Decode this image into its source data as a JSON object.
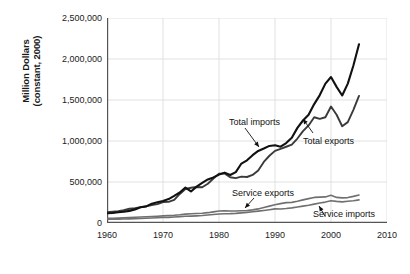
{
  "chart_data": {
    "type": "line",
    "title": "",
    "xlabel": "Year",
    "ylabel_line1": "Million Dollars",
    "ylabel_line2": "(constant, 2000)",
    "xlim": [
      1960,
      2010
    ],
    "ylim": [
      0,
      2500000
    ],
    "grid": true,
    "legend_position": "inline-annotations",
    "xticks": [
      "1960",
      "1970",
      "1980",
      "1990",
      "2000",
      "2010"
    ],
    "xtick_values": [
      1960,
      1970,
      1980,
      1990,
      2000,
      2010
    ],
    "yticks": [
      "0",
      "500,000",
      "1,000,000",
      "1,500,000",
      "2,000,000",
      "2,500,000"
    ],
    "ytick_values": [
      0,
      500000,
      1000000,
      1500000,
      2000000,
      2500000
    ],
    "x": [
      1960,
      1961,
      1962,
      1963,
      1964,
      1965,
      1966,
      1967,
      1968,
      1969,
      1970,
      1971,
      1972,
      1973,
      1974,
      1975,
      1976,
      1977,
      1978,
      1979,
      1980,
      1981,
      1982,
      1983,
      1984,
      1985,
      1986,
      1987,
      1988,
      1989,
      1990,
      1991,
      1992,
      1993,
      1994,
      1995,
      1996,
      1997,
      1998,
      1999,
      2000,
      2001,
      2002,
      2003,
      2004,
      2005
    ],
    "series": [
      {
        "name": "Total imports",
        "color": "#111111",
        "width": 2.1,
        "values": [
          118000,
          122000,
          132000,
          138000,
          148000,
          166000,
          191000,
          203000,
          236000,
          252000,
          268000,
          292000,
          330000,
          372000,
          432000,
          385000,
          444000,
          488000,
          531000,
          556000,
          590000,
          614000,
          585000,
          620000,
          725000,
          764000,
          827000,
          879000,
          908000,
          940000,
          948000,
          930000,
          975000,
          1040000,
          1160000,
          1250000,
          1320000,
          1450000,
          1560000,
          1700000,
          1780000,
          1660000,
          1555000,
          1700000,
          1920000,
          2180000
        ]
      },
      {
        "name": "Total exports",
        "color": "#3a3a3a",
        "width": 1.9,
        "values": [
          131000,
          137000,
          144000,
          155000,
          174000,
          180000,
          194000,
          203000,
          219000,
          230000,
          256000,
          258000,
          281000,
          354000,
          414000,
          430000,
          439000,
          436000,
          478000,
          543000,
          600000,
          605000,
          558000,
          547000,
          566000,
          561000,
          586000,
          640000,
          745000,
          820000,
          880000,
          905000,
          930000,
          955000,
          1030000,
          1120000,
          1190000,
          1290000,
          1270000,
          1290000,
          1420000,
          1320000,
          1180000,
          1230000,
          1380000,
          1550000
        ]
      },
      {
        "name": "Service exports",
        "color": "#707070",
        "width": 1.6,
        "values": [
          56000,
          58000,
          60000,
          63000,
          67000,
          70000,
          73000,
          77000,
          80000,
          83000,
          87000,
          90000,
          94000,
          100000,
          108000,
          112000,
          116000,
          119000,
          126000,
          136000,
          146000,
          149000,
          147000,
          146000,
          150000,
          152000,
          160000,
          172000,
          190000,
          206000,
          222000,
          236000,
          248000,
          252000,
          265000,
          282000,
          297000,
          312000,
          316000,
          318000,
          338000,
          312000,
          306000,
          310000,
          325000,
          342000
        ]
      },
      {
        "name": "Service imports",
        "color": "#707070",
        "width": 1.6,
        "values": [
          45000,
          46000,
          47000,
          48000,
          50000,
          52000,
          55000,
          58000,
          61000,
          64000,
          67000,
          69000,
          73000,
          78000,
          82000,
          84000,
          87000,
          91000,
          97000,
          104000,
          110000,
          113000,
          114000,
          117000,
          124000,
          130000,
          137000,
          145000,
          153000,
          162000,
          172000,
          170000,
          176000,
          184000,
          195000,
          206000,
          216000,
          230000,
          243000,
          255000,
          272000,
          264000,
          258000,
          265000,
          272000,
          282000
        ]
      }
    ],
    "annotations": [
      {
        "name": "total-imports",
        "text": "Total imports"
      },
      {
        "name": "total-exports",
        "text": "Total exports"
      },
      {
        "name": "service-exports",
        "text": "Service exports"
      },
      {
        "name": "service-imports",
        "text": "Service imports"
      }
    ]
  }
}
